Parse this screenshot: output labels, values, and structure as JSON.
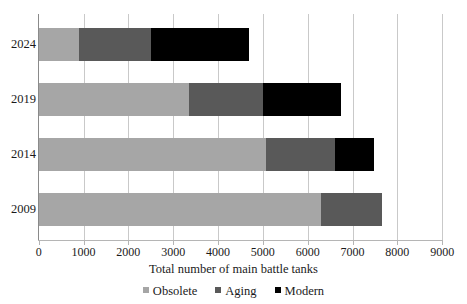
{
  "chart_data": {
    "type": "bar",
    "orientation": "horizontal",
    "stacked": true,
    "title": "",
    "xlabel": "Total number of main battle tanks",
    "ylabel": "",
    "xlim": [
      0,
      9000
    ],
    "xticks": [
      0,
      1000,
      2000,
      3000,
      4000,
      5000,
      6000,
      7000,
      8000,
      9000
    ],
    "xtick_labels": [
      "0",
      "1000",
      "2000",
      "3000",
      "4000",
      "5000",
      "6000",
      "7000",
      "8000",
      "9000"
    ],
    "categories": [
      "2024",
      "2019",
      "2014",
      "2009"
    ],
    "grid": "vertical",
    "legend_position": "bottom",
    "series": [
      {
        "name": "Obsolete",
        "color": "#a6a6a6",
        "values": [
          900,
          3350,
          5080,
          6300
        ]
      },
      {
        "name": "Aging",
        "color": "#595959",
        "values": [
          1600,
          1650,
          1520,
          1360
        ]
      },
      {
        "name": "Modern",
        "color": "#000000",
        "values": [
          2190,
          1750,
          870,
          0
        ]
      }
    ],
    "totals": [
      4690,
      6750,
      7470,
      7660
    ]
  },
  "axis": {
    "x_title": "Total number of main battle tanks"
  },
  "legend": {
    "items": [
      {
        "label": "Obsolete",
        "color": "#a6a6a6"
      },
      {
        "label": "Aging",
        "color": "#595959"
      },
      {
        "label": "Modern",
        "color": "#000000"
      }
    ]
  }
}
